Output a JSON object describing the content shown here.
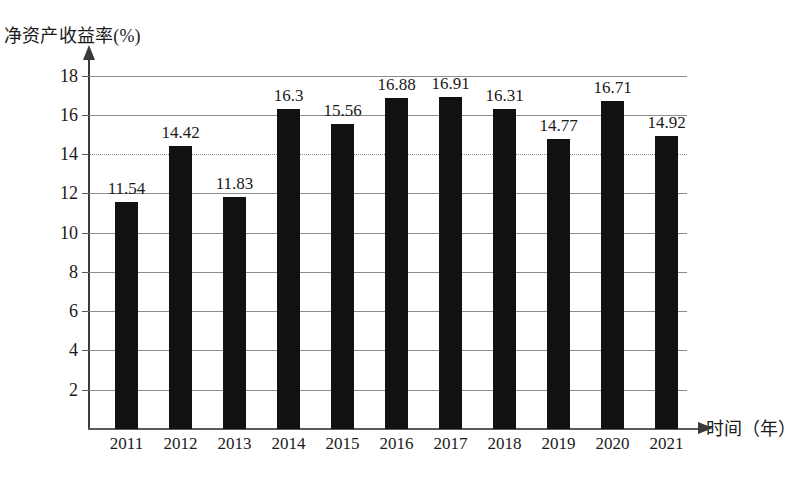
{
  "chart_data": {
    "type": "bar",
    "title": "",
    "ylabel": "净资产收益率(%)",
    "xlabel": "时间（年）",
    "categories": [
      "2011",
      "2012",
      "2013",
      "2014",
      "2015",
      "2016",
      "2017",
      "2018",
      "2019",
      "2020",
      "2021"
    ],
    "values": [
      11.54,
      14.42,
      11.83,
      16.3,
      15.56,
      16.88,
      16.91,
      16.31,
      14.77,
      16.71,
      14.92
    ],
    "value_labels": [
      "11.54",
      "14.42",
      "11.83",
      "16.3",
      "15.56",
      "16.88",
      "16.91",
      "16.31",
      "14.77",
      "16.71",
      "14.92"
    ],
    "ylim": [
      0,
      19.2
    ],
    "yticks": [
      2,
      4,
      6,
      8,
      10,
      12,
      14,
      16,
      18
    ],
    "ytick_labels": [
      "2",
      "4",
      "6",
      "8",
      "10",
      "12",
      "14",
      "16",
      "18"
    ],
    "grid": true,
    "gridline_style": {
      "default": "solid",
      "dotted_at": [
        14
      ]
    },
    "legend": null,
    "bar_color": "#111111",
    "grid_color": "#8c8c8c",
    "axis_color": "#3a3a3a"
  }
}
